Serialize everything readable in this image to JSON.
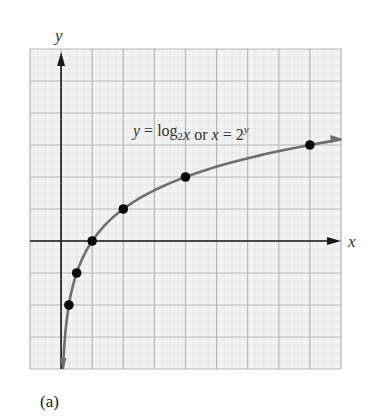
{
  "chart_data": {
    "type": "line",
    "title": "",
    "panel_label": "(a)",
    "xlabel": "x",
    "ylabel": "y",
    "xlim": [
      -1,
      9
    ],
    "ylim": [
      -4,
      6
    ],
    "grid": true,
    "grid_step": 1,
    "tick_labels": false,
    "series": [
      {
        "name": "y = log2 x",
        "function": "log2(x)",
        "annotation": {
          "parts": [
            "y = log",
            "2",
            "x or x = 2",
            "y"
          ],
          "x": 1.35,
          "y": 3.3
        },
        "points": [
          {
            "x": 0.25,
            "y": -2
          },
          {
            "x": 0.5,
            "y": -1
          },
          {
            "x": 1,
            "y": 0
          },
          {
            "x": 2,
            "y": 1
          },
          {
            "x": 4,
            "y": 2
          },
          {
            "x": 8,
            "y": 3
          }
        ]
      }
    ],
    "colors": {
      "grid_major": "#b5b5b5",
      "grid_minor": "#dcdcdc",
      "grid_bg": "#f2f2f2",
      "axes": "#1a1a1a",
      "curve": "#6e6e6e",
      "points": "#0a0a0a",
      "text": "#333333"
    }
  }
}
